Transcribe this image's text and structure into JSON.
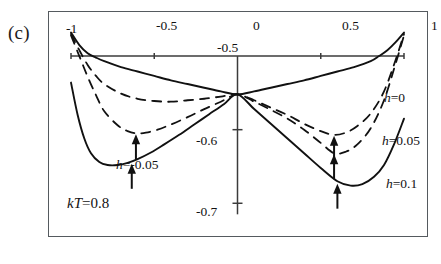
{
  "figure": {
    "panel_label": "(c)",
    "annotation_kT": "kT=0.8"
  },
  "chart_data": {
    "type": "line",
    "title": "",
    "subtitle": "",
    "xlabel": "",
    "ylabel": "",
    "xlim": [
      -1.0,
      1.0
    ],
    "ylim": [
      -0.72,
      -0.47
    ],
    "grid": false,
    "legend_position": "inline-right",
    "x_ticks": [
      -1,
      -0.5,
      0,
      0.5,
      1
    ],
    "x_tick_labels": [
      "-1",
      "-0.5",
      "0",
      "0.5",
      "1"
    ],
    "y_ticks": [
      -0.5,
      -0.6,
      -0.7
    ],
    "y_tick_labels": [
      "-0.5",
      "-0.6",
      "-0.7"
    ],
    "axis_style": "centered-cross",
    "annotations": [
      {
        "text": "kT=0.8",
        "x": -0.62,
        "y": -0.695
      },
      {
        "text": "h=0",
        "x": 0.82,
        "y": -0.545
      },
      {
        "text": "h=0.05",
        "x": 0.8,
        "y": -0.588
      },
      {
        "text": "h=0.1",
        "x": 0.84,
        "y": -0.635
      }
    ],
    "arrow_markers": [
      {
        "series": "h=-0.05",
        "x": -0.61,
        "y": -0.605
      },
      {
        "series": "h=0.1",
        "x": -0.635,
        "y": -0.645
      },
      {
        "series": "h=0.05",
        "x": 0.58,
        "y": -0.607
      },
      {
        "series": "h=-0.05",
        "x": 0.58,
        "y": -0.632
      },
      {
        "series": "h=0.1",
        "x": 0.6,
        "y": -0.672
      }
    ],
    "series": [
      {
        "name": "h=0",
        "label": "h=0",
        "style": "solid",
        "color": "#111111",
        "x": [
          -1.0,
          -0.95,
          -0.9,
          -0.85,
          -0.8,
          -0.7,
          -0.6,
          -0.5,
          -0.4,
          -0.3,
          -0.2,
          -0.1,
          0.0,
          0.1,
          0.2,
          0.3,
          0.4,
          0.5,
          0.6,
          0.7,
          0.8,
          0.85,
          0.9,
          0.95,
          1.0
        ],
        "y": [
          -0.468,
          -0.485,
          -0.496,
          -0.502,
          -0.507,
          -0.515,
          -0.521,
          -0.527,
          -0.533,
          -0.538,
          -0.543,
          -0.548,
          -0.552,
          -0.548,
          -0.543,
          -0.538,
          -0.533,
          -0.527,
          -0.521,
          -0.515,
          -0.507,
          -0.5,
          -0.492,
          -0.481,
          -0.468
        ]
      },
      {
        "name": "h=0.05",
        "label": "h=0.05",
        "style": "dashed",
        "color": "#111111",
        "x": [
          -1.0,
          -0.95,
          -0.9,
          -0.85,
          -0.8,
          -0.7,
          -0.6,
          -0.5,
          -0.4,
          -0.3,
          -0.2,
          -0.1,
          0.0,
          0.1,
          0.2,
          0.3,
          0.4,
          0.5,
          0.58,
          0.65,
          0.72,
          0.8,
          0.88,
          0.95,
          1.0
        ],
        "y": [
          -0.47,
          -0.492,
          -0.512,
          -0.527,
          -0.538,
          -0.551,
          -0.558,
          -0.561,
          -0.562,
          -0.56,
          -0.558,
          -0.555,
          -0.552,
          -0.56,
          -0.57,
          -0.58,
          -0.592,
          -0.602,
          -0.607,
          -0.604,
          -0.595,
          -0.578,
          -0.548,
          -0.505,
          -0.47
        ]
      },
      {
        "name": "h=-0.05",
        "label": "h=-0.05",
        "style": "mixed",
        "color": "#111111",
        "x": [
          -1.0,
          -0.95,
          -0.9,
          -0.85,
          -0.8,
          -0.72,
          -0.66,
          -0.61,
          -0.55,
          -0.48,
          -0.4,
          -0.3,
          -0.2,
          -0.1,
          0.0,
          0.1,
          0.2,
          0.3,
          0.4,
          0.5,
          0.58,
          0.65,
          0.72,
          0.8,
          0.88,
          0.95,
          1.0
        ],
        "y": [
          -0.472,
          -0.5,
          -0.528,
          -0.553,
          -0.575,
          -0.594,
          -0.602,
          -0.605,
          -0.604,
          -0.6,
          -0.593,
          -0.583,
          -0.572,
          -0.562,
          -0.552,
          -0.562,
          -0.573,
          -0.585,
          -0.6,
          -0.618,
          -0.632,
          -0.63,
          -0.62,
          -0.598,
          -0.56,
          -0.51,
          -0.472
        ]
      },
      {
        "name": "h=0.1",
        "label": "h=0.1",
        "style": "solid",
        "color": "#111111",
        "x": [
          -1.0,
          -0.96,
          -0.92,
          -0.88,
          -0.83,
          -0.78,
          -0.72,
          -0.66,
          -0.6,
          -0.52,
          -0.44,
          -0.35,
          -0.26,
          -0.17,
          -0.08,
          0.0,
          0.1,
          0.2,
          0.3,
          0.4,
          0.5,
          0.6,
          0.68,
          0.75,
          0.82,
          0.88,
          0.94,
          1.0
        ],
        "y": [
          -0.536,
          -0.58,
          -0.612,
          -0.632,
          -0.644,
          -0.648,
          -0.648,
          -0.645,
          -0.64,
          -0.631,
          -0.62,
          -0.607,
          -0.593,
          -0.579,
          -0.565,
          -0.552,
          -0.572,
          -0.592,
          -0.612,
          -0.632,
          -0.652,
          -0.67,
          -0.676,
          -0.674,
          -0.664,
          -0.648,
          -0.62,
          -0.585
        ]
      }
    ]
  }
}
